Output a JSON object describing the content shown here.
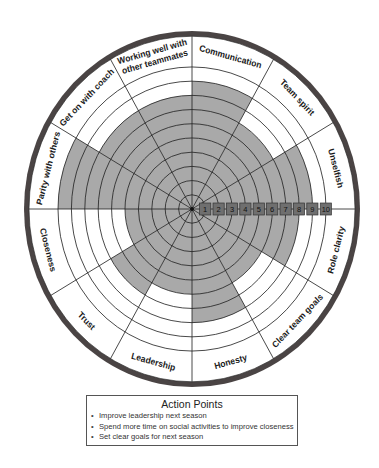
{
  "chart_data": {
    "type": "radial-wheel",
    "scale": {
      "min": 1,
      "max": 10,
      "ticks": [
        "1",
        "2",
        "3",
        "4",
        "5",
        "6",
        "7",
        "8",
        "9",
        "10"
      ]
    },
    "categories": [
      "Communication",
      "Team spirit",
      "Unselfish",
      "Role clarity",
      "Clear team goals",
      "Honesty",
      "Leadership",
      "Trust",
      "Closeness",
      "Parity with others",
      "Get on with coach",
      "Working well with other teammates"
    ],
    "values": [
      9,
      7,
      9,
      8,
      6,
      8,
      6,
      7,
      5,
      10,
      8,
      8
    ],
    "colors": {
      "shade": "#a9a9a9",
      "rim": "#4a4444",
      "grid": "#222222",
      "scale_box": "#6f6f6f"
    }
  },
  "wheel": {
    "segments": [
      {
        "label_lines": [
          "Communication"
        ],
        "value": 9
      },
      {
        "label_lines": [
          "Team spirit"
        ],
        "value": 7
      },
      {
        "label_lines": [
          "Unselfish"
        ],
        "value": 9
      },
      {
        "label_lines": [
          "Role clarity"
        ],
        "value": 8
      },
      {
        "label_lines": [
          "Clear team goals"
        ],
        "value": 6
      },
      {
        "label_lines": [
          "Honesty"
        ],
        "value": 8
      },
      {
        "label_lines": [
          "Leadership"
        ],
        "value": 6
      },
      {
        "label_lines": [
          "Trust"
        ],
        "value": 7
      },
      {
        "label_lines": [
          "Closeness"
        ],
        "value": 5
      },
      {
        "label_lines": [
          "Parity with others"
        ],
        "value": 10
      },
      {
        "label_lines": [
          "Get on with coach"
        ],
        "value": 8
      },
      {
        "label_lines": [
          "Working well with",
          "other teammates"
        ],
        "value": 8
      }
    ]
  },
  "action_points": {
    "title": "Action Points",
    "items": [
      "Improve leadership next season",
      "Spend more time on social activities to improve closeness",
      "Set clear goals for next season"
    ]
  }
}
